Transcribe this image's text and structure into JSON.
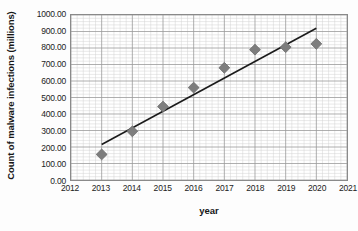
{
  "chart_data": {
    "type": "scatter",
    "title": "",
    "xlabel": "year",
    "ylabel": "Count of malware infections (millions)",
    "xlim": [
      2012,
      2021
    ],
    "ylim": [
      0,
      1000
    ],
    "grid": true,
    "legend": false,
    "minor_grid_divisions": 5,
    "x": [
      2013,
      2014,
      2015,
      2016,
      2017,
      2018,
      2019,
      2020
    ],
    "values": [
      155,
      295,
      445,
      560,
      680,
      790,
      805,
      825
    ],
    "points": [
      {
        "x": 2013,
        "y": 155
      },
      {
        "x": 2014,
        "y": 295
      },
      {
        "x": 2015,
        "y": 445
      },
      {
        "x": 2016,
        "y": 560
      },
      {
        "x": 2017,
        "y": 680
      },
      {
        "x": 2018,
        "y": 790
      },
      {
        "x": 2019,
        "y": 805
      },
      {
        "x": 2020,
        "y": 825
      }
    ],
    "marker": {
      "shape": "diamond",
      "color": "#7d7d7d",
      "edge_color": "#6a6a6a",
      "size": 11
    },
    "trendline": {
      "visible": true,
      "color": "#1b1b1b",
      "width": 1.6,
      "x_start": 2013,
      "y_start": 215,
      "x_end": 2020,
      "y_end": 920
    },
    "x_ticks": [
      2012,
      2013,
      2014,
      2015,
      2016,
      2017,
      2018,
      2019,
      2020,
      2021
    ],
    "x_tick_labels": [
      "2012",
      "2013",
      "2014",
      "2015",
      "2016",
      "2017",
      "2018",
      "2019",
      "2020",
      "2021"
    ],
    "y_ticks": [
      0,
      100,
      200,
      300,
      400,
      500,
      600,
      700,
      800,
      900,
      1000
    ],
    "y_tick_labels": [
      "0.00",
      "100.00",
      "200.00",
      "300.00",
      "400.00",
      "500.00",
      "600.00",
      "700.00",
      "800.00",
      "900.00",
      "1000.00"
    ],
    "colors": {
      "plot_background": "#ffffff",
      "page_background": "#fdfdfd",
      "major_grid": "#9a9a9a",
      "minor_grid": "#d2d2d2",
      "axis_border": "#8a8a8a",
      "text": "#1a1a1a"
    }
  }
}
